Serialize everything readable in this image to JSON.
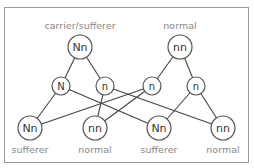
{
  "diagram": {
    "type": "genetic-cross",
    "parents": [
      {
        "id": "p1",
        "genotype": "Nn",
        "label": "carrier/sufferer",
        "x": 80,
        "y": 47,
        "r": 12
      },
      {
        "id": "p2",
        "genotype": "nn",
        "label": "normal",
        "x": 180,
        "y": 47,
        "r": 12
      }
    ],
    "gametes": [
      {
        "id": "g1",
        "allele": "N",
        "parent": "p1",
        "x": 61,
        "y": 86,
        "r": 9
      },
      {
        "id": "g2",
        "allele": "n",
        "parent": "p1",
        "x": 105,
        "y": 86,
        "r": 9
      },
      {
        "id": "g3",
        "allele": "n",
        "parent": "p2",
        "x": 152,
        "y": 86,
        "r": 9
      },
      {
        "id": "g4",
        "allele": "n",
        "parent": "p2",
        "x": 196,
        "y": 86,
        "r": 9
      }
    ],
    "offspring": [
      {
        "id": "o1",
        "genotype": "Nn",
        "label": "sufferer",
        "x": 30,
        "y": 128,
        "r": 12
      },
      {
        "id": "o2",
        "genotype": "nn",
        "label": "normal",
        "x": 95,
        "y": 128,
        "r": 12
      },
      {
        "id": "o3",
        "genotype": "Nn",
        "label": "sufferer",
        "x": 159,
        "y": 128,
        "r": 12
      },
      {
        "id": "o4",
        "genotype": "nn",
        "label": "normal",
        "x": 223,
        "y": 128,
        "r": 12
      }
    ],
    "edges": [
      [
        "p1",
        "g1"
      ],
      [
        "p1",
        "g2"
      ],
      [
        "p2",
        "g3"
      ],
      [
        "p2",
        "g4"
      ],
      [
        "g1",
        "o1"
      ],
      [
        "g1",
        "o3"
      ],
      [
        "g2",
        "o2"
      ],
      [
        "g2",
        "o4"
      ],
      [
        "g3",
        "o1"
      ],
      [
        "g3",
        "o2"
      ],
      [
        "g4",
        "o3"
      ],
      [
        "g4",
        "o4"
      ]
    ]
  }
}
